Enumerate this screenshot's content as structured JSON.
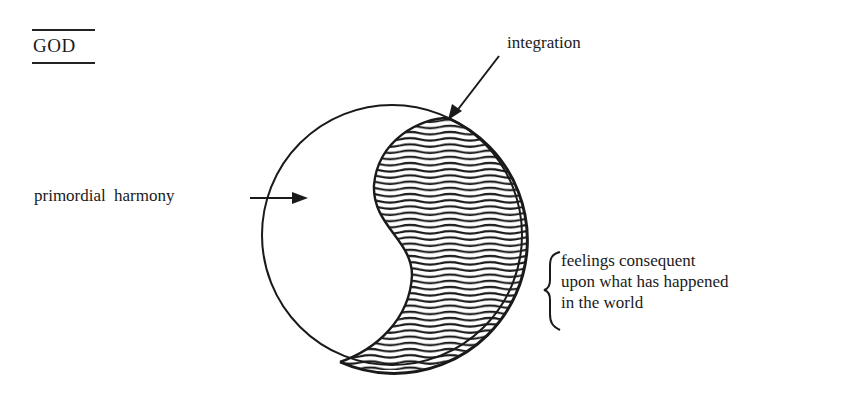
{
  "diagram": {
    "title": "GOD",
    "labels": {
      "integration": "integration",
      "primordial": "primordial harmony",
      "feelings_lines": [
        "feelings consequent",
        "upon what has happened",
        "in the world"
      ]
    },
    "shapes": {
      "circle": {
        "cx": 392,
        "cy": 235,
        "r": 130
      },
      "hatched_region": "consequent nature (wavy horizontal hatching)",
      "blank_region": "primordial nature"
    },
    "colors": {
      "ink": "#1a1a1a",
      "background": "#ffffff"
    }
  }
}
